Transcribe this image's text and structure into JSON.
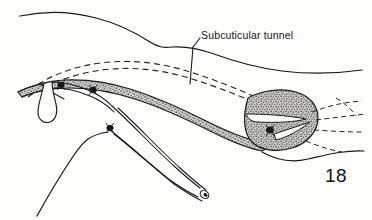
{
  "figure": {
    "domain": "medical-surgical-line-illustration",
    "number": "18",
    "annotations": [
      {
        "id": "subcuticular-tunnel",
        "text": "Subcuticular tunnel",
        "x": 201,
        "y": 30,
        "leader_from": [
          198,
          40
        ],
        "leader_to": [
          190,
          84
        ]
      }
    ],
    "colors": {
      "background": "#fdfdfc",
      "ink": "#1a1a1c",
      "stipple_fill": "#b9b7b2",
      "stipple_dots": "#2b2b2d",
      "dashed_line": "#2a2a2c",
      "text": "#17171a"
    },
    "elements": [
      {
        "name": "upper-skin-contour",
        "type": "contour-line",
        "style": "solid"
      },
      {
        "name": "lower-skin-contour",
        "type": "contour-line",
        "style": "solid"
      },
      {
        "name": "right-skin-contour",
        "type": "contour-line",
        "style": "solid"
      },
      {
        "name": "subcuticular-tunnel-dashed-upper",
        "type": "tunnel-path",
        "style": "dashed"
      },
      {
        "name": "subcuticular-tunnel-dashed-lower",
        "type": "tunnel-path",
        "style": "dashed"
      },
      {
        "name": "dissected-flap-band",
        "type": "stippled-region",
        "style": "stipple"
      },
      {
        "name": "exit-site-oval",
        "type": "stippled-region",
        "style": "stipple"
      },
      {
        "name": "catheter-tube-proximal",
        "type": "catheter",
        "style": "double-line"
      },
      {
        "name": "catheter-tube-distal",
        "type": "catheter",
        "style": "double-line"
      },
      {
        "name": "catheter-tip",
        "type": "catheter-tip",
        "style": "filled"
      },
      {
        "name": "catheter-loop",
        "type": "catheter-loop",
        "style": "outline"
      },
      {
        "name": "suture-knot-proximal",
        "type": "suture-knot",
        "style": "filled"
      },
      {
        "name": "suture-knot-mid",
        "type": "suture-knot",
        "style": "filled"
      },
      {
        "name": "suture-knot-exit",
        "type": "suture-knot",
        "style": "filled"
      },
      {
        "name": "radiating-dashed-lines",
        "type": "tissue-marks",
        "style": "dashed"
      }
    ]
  }
}
